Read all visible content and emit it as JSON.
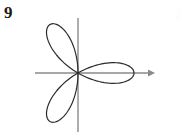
{
  "figure": {
    "problem_number": "9",
    "background_color": "#ffffff",
    "width": 183,
    "height": 139
  },
  "axes": {
    "color": "#8a8a8a",
    "stroke_width": 1.4,
    "x_axis": {
      "label": "x-axis",
      "x_start": 35,
      "x_end": 155,
      "y": 73,
      "has_arrow": true,
      "arrow_side": "right"
    },
    "y_axis": {
      "label": "y-axis",
      "x": 78,
      "y_start": 18,
      "y_end": 132,
      "has_arrow": false
    },
    "origin": {
      "x": 78,
      "y": 73
    }
  },
  "chart_data": {
    "type": "line",
    "title": "",
    "subtitle": "",
    "xlabel": "",
    "ylabel": "",
    "coordinate_system": "polar",
    "equation": "r = a cos(3θ)",
    "petal_count": 3,
    "grid": false,
    "legend": null,
    "curve_color": "#2b2b2b",
    "curve_stroke_width": 1.2,
    "amplitude_px": 56,
    "petal_angles_deg": [
      0,
      120,
      240
    ],
    "petals": [
      {
        "name": "right-petal",
        "angle_deg": 0,
        "tip_x": 134,
        "tip_y": 73,
        "half_width_deg": 30
      },
      {
        "name": "upper-left-petal",
        "angle_deg": 120,
        "tip_x": 56,
        "tip_y": 31,
        "half_width_deg": 30
      },
      {
        "name": "lower-left-petal",
        "angle_deg": 240,
        "tip_x": 56,
        "tip_y": 115,
        "half_width_deg": 30
      }
    ],
    "theta_range_deg": [
      0,
      360
    ],
    "theta_step_deg": 1,
    "ylim": [
      -56,
      56
    ],
    "xlim": [
      -56,
      56
    ]
  }
}
